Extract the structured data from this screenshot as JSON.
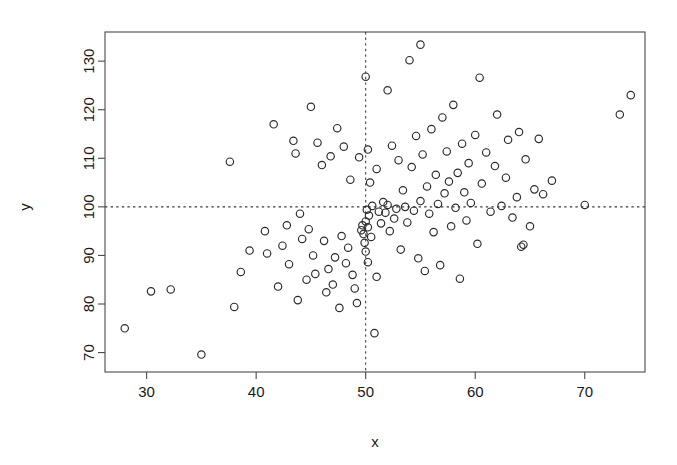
{
  "chart_data": {
    "type": "scatter",
    "title": "",
    "xlabel": "x",
    "ylabel": "y",
    "xlim": [
      26.2,
      75.5
    ],
    "ylim": [
      66.0,
      136.0
    ],
    "xticks": [
      30,
      40,
      50,
      60,
      70
    ],
    "yticks": [
      70,
      80,
      90,
      100,
      110,
      120,
      130
    ],
    "grid": false,
    "legend": null,
    "marker": "open-circle",
    "marker_color": "#2b2b2b",
    "annotations": [
      {
        "type": "vline",
        "x": 50,
        "style": "dashed",
        "label": "x reference line at 50"
      },
      {
        "type": "hline",
        "y": 100,
        "style": "dashed",
        "label": "y reference line at 100"
      }
    ],
    "n_points": 132,
    "points": [
      [
        28.0,
        75.0
      ],
      [
        30.4,
        82.6
      ],
      [
        32.2,
        83.0
      ],
      [
        35.0,
        69.6
      ],
      [
        37.6,
        109.3
      ],
      [
        38.0,
        79.4
      ],
      [
        38.6,
        86.6
      ],
      [
        41.0,
        90.4
      ],
      [
        41.6,
        117.0
      ],
      [
        42.0,
        83.6
      ],
      [
        42.4,
        92.0
      ],
      [
        43.0,
        88.2
      ],
      [
        43.4,
        113.6
      ],
      [
        43.6,
        111.0
      ],
      [
        43.8,
        80.8
      ],
      [
        44.2,
        93.4
      ],
      [
        44.6,
        85.0
      ],
      [
        45.0,
        120.6
      ],
      [
        45.4,
        86.2
      ],
      [
        45.6,
        113.2
      ],
      [
        46.0,
        108.6
      ],
      [
        46.2,
        93.0
      ],
      [
        46.4,
        82.4
      ],
      [
        46.8,
        110.4
      ],
      [
        47.0,
        84.0
      ],
      [
        47.2,
        89.6
      ],
      [
        47.4,
        116.2
      ],
      [
        47.6,
        79.2
      ],
      [
        48.0,
        112.4
      ],
      [
        48.2,
        88.4
      ],
      [
        48.4,
        91.6
      ],
      [
        48.6,
        105.6
      ],
      [
        48.8,
        86.0
      ],
      [
        49.0,
        83.2
      ],
      [
        49.2,
        80.2
      ],
      [
        49.4,
        110.2
      ],
      [
        49.6,
        95.2
      ],
      [
        49.7,
        96.2
      ],
      [
        49.8,
        94.4
      ],
      [
        49.9,
        92.6
      ],
      [
        50.0,
        126.8
      ],
      [
        50.0,
        97.0
      ],
      [
        50.0,
        90.8
      ],
      [
        50.1,
        99.4
      ],
      [
        50.2,
        111.8
      ],
      [
        50.2,
        95.8
      ],
      [
        50.3,
        98.2
      ],
      [
        50.4,
        105.0
      ],
      [
        50.5,
        93.8
      ],
      [
        50.6,
        100.2
      ],
      [
        50.8,
        74.0
      ],
      [
        51.0,
        107.8
      ],
      [
        51.2,
        99.0
      ],
      [
        51.4,
        96.6
      ],
      [
        51.6,
        101.0
      ],
      [
        51.8,
        98.8
      ],
      [
        52.0,
        124.0
      ],
      [
        52.0,
        100.4
      ],
      [
        52.2,
        95.0
      ],
      [
        52.4,
        112.6
      ],
      [
        52.6,
        97.6
      ],
      [
        52.8,
        99.6
      ],
      [
        53.0,
        109.6
      ],
      [
        53.2,
        91.2
      ],
      [
        53.4,
        103.4
      ],
      [
        53.6,
        100.0
      ],
      [
        53.8,
        96.8
      ],
      [
        54.0,
        130.2
      ],
      [
        54.2,
        108.2
      ],
      [
        54.4,
        99.2
      ],
      [
        54.6,
        114.6
      ],
      [
        54.8,
        89.4
      ],
      [
        55.0,
        133.4
      ],
      [
        55.0,
        101.2
      ],
      [
        55.2,
        110.8
      ],
      [
        55.4,
        86.8
      ],
      [
        55.6,
        104.2
      ],
      [
        55.8,
        98.6
      ],
      [
        56.0,
        116.0
      ],
      [
        56.2,
        94.8
      ],
      [
        56.4,
        106.6
      ],
      [
        56.6,
        100.6
      ],
      [
        56.8,
        88.0
      ],
      [
        57.0,
        118.4
      ],
      [
        57.2,
        102.8
      ],
      [
        57.4,
        111.4
      ],
      [
        57.6,
        105.2
      ],
      [
        57.8,
        96.0
      ],
      [
        58.0,
        121.0
      ],
      [
        58.2,
        99.8
      ],
      [
        58.4,
        107.0
      ],
      [
        58.6,
        85.2
      ],
      [
        58.8,
        113.0
      ],
      [
        59.0,
        103.0
      ],
      [
        59.2,
        97.2
      ],
      [
        59.4,
        109.0
      ],
      [
        59.6,
        100.8
      ],
      [
        60.0,
        114.8
      ],
      [
        60.2,
        92.4
      ],
      [
        60.4,
        126.6
      ],
      [
        60.6,
        104.8
      ],
      [
        61.0,
        111.2
      ],
      [
        61.4,
        99.0
      ],
      [
        61.8,
        108.4
      ],
      [
        62.0,
        119.0
      ],
      [
        62.4,
        100.2
      ],
      [
        62.8,
        106.0
      ],
      [
        63.0,
        113.8
      ],
      [
        63.4,
        97.8
      ],
      [
        63.8,
        102.0
      ],
      [
        64.0,
        115.4
      ],
      [
        64.2,
        91.8
      ],
      [
        64.4,
        92.2
      ],
      [
        64.6,
        109.8
      ],
      [
        65.0,
        96.0
      ],
      [
        65.4,
        103.6
      ],
      [
        65.8,
        114.0
      ],
      [
        66.2,
        102.6
      ],
      [
        67.0,
        105.4
      ],
      [
        70.0,
        100.4
      ],
      [
        73.2,
        119.0
      ],
      [
        74.2,
        123.0
      ],
      [
        44.8,
        95.4
      ],
      [
        45.2,
        90.0
      ],
      [
        46.6,
        87.2
      ],
      [
        47.8,
        94.0
      ],
      [
        50.2,
        88.6
      ],
      [
        51.0,
        85.6
      ],
      [
        44.0,
        98.6
      ],
      [
        42.8,
        96.2
      ],
      [
        40.8,
        95.0
      ],
      [
        39.4,
        91.0
      ]
    ]
  },
  "axes": {
    "x_title": "x",
    "y_title": "y"
  }
}
